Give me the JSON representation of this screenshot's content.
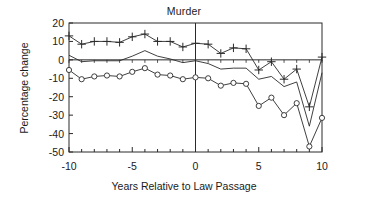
{
  "chart_data": {
    "type": "line",
    "title": "Murder",
    "xlabel": "Years Relative to Law Passage",
    "ylabel": "Percentage change",
    "xlim": [
      -10,
      10
    ],
    "ylim": [
      -50,
      20
    ],
    "xticks": [
      -10,
      -5,
      0,
      5,
      10
    ],
    "xtick_labels": [
      "-10",
      "-5",
      "0",
      "5",
      "10"
    ],
    "yticks": [
      20,
      10,
      0,
      -10,
      -20,
      -30,
      -40,
      -50
    ],
    "ytick_labels": [
      "20",
      "10",
      "0",
      "-10",
      "-20",
      "-30",
      "-40",
      "-50"
    ],
    "grid": false,
    "legend": "none",
    "reference_lines": {
      "vertical_x": 0,
      "horizontal_y": 0
    },
    "x": [
      -10,
      -9,
      -8,
      -7,
      -6,
      -5,
      -4,
      -3,
      -2,
      -1,
      0,
      1,
      2,
      3,
      4,
      5,
      6,
      7,
      8,
      9,
      10
    ],
    "series": [
      {
        "name": "upper-confidence-band",
        "marker": "plus",
        "values": [
          13,
          8.5,
          10,
          10,
          9.5,
          12.5,
          14,
          10,
          10,
          7,
          9,
          8.5,
          3.5,
          6.5,
          6,
          -5.5,
          -1,
          -10.5,
          -5,
          -25.5,
          1.5
        ]
      },
      {
        "name": "point-estimate",
        "marker": "none",
        "values": [
          2.5,
          -1,
          -0.5,
          -0.5,
          -0.5,
          2,
          5,
          2,
          0.5,
          -1.5,
          -0.5,
          -2,
          -5,
          -4.5,
          -4.5,
          -10.5,
          -9,
          -14.5,
          -12,
          -36,
          -7
        ]
      },
      {
        "name": "lower-confidence-band",
        "marker": "circle",
        "values": [
          -5.5,
          -10.5,
          -9,
          -8.5,
          -9,
          -6.5,
          -4.5,
          -8,
          -8.5,
          -10.5,
          -9.5,
          -10,
          -14,
          -12.5,
          -13,
          -25,
          -20.5,
          -30,
          -23.5,
          -47,
          -31.5
        ]
      }
    ]
  }
}
